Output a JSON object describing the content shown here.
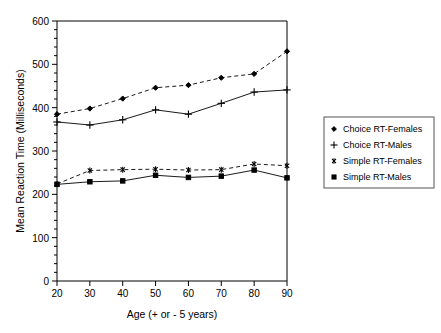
{
  "chart_data": {
    "type": "line",
    "title": "",
    "xlabel": "Age (+ or - 5 years)",
    "ylabel": "Mean Reaction Time (Milliseconds)",
    "x": [
      20,
      30,
      40,
      50,
      60,
      70,
      80,
      90
    ],
    "xlim": [
      20,
      90
    ],
    "ylim": [
      0,
      600
    ],
    "xticks": [
      "20",
      "30",
      "40",
      "50",
      "60",
      "70",
      "80",
      "90"
    ],
    "yticks": [
      "0",
      "100",
      "200",
      "300",
      "400",
      "500",
      "600"
    ],
    "y_minor_tick_step": 20,
    "grid": false,
    "legend_position": "right-outside",
    "series": [
      {
        "name": "Choice RT-Females",
        "marker": "diamond",
        "linestyle": "dashed",
        "color": "#000000",
        "values": [
          385,
          398,
          421,
          446,
          452,
          469,
          478,
          530
        ]
      },
      {
        "name": "Choice RT-Males",
        "marker": "plus",
        "linestyle": "solid",
        "color": "#000000",
        "values": [
          367,
          360,
          372,
          395,
          385,
          410,
          436,
          441
        ]
      },
      {
        "name": "Simple RT-Females",
        "marker": "asterisk",
        "linestyle": "dashed",
        "color": "#000000",
        "values": [
          224,
          255,
          257,
          258,
          256,
          257,
          270,
          266
        ]
      },
      {
        "name": "Simple RT-Males",
        "marker": "square",
        "linestyle": "solid",
        "color": "#000000",
        "values": [
          223,
          229,
          231,
          244,
          239,
          242,
          256,
          238
        ]
      }
    ]
  },
  "axes": {
    "x_title": "Age (+ or - 5 years)",
    "y_title": "Mean Reaction Time (Milliseconds)",
    "y_tick_0": "0",
    "y_tick_1": "100",
    "y_tick_2": "200",
    "y_tick_3": "300",
    "y_tick_4": "400",
    "y_tick_5": "500",
    "y_tick_6": "600",
    "x_tick_0": "20",
    "x_tick_1": "30",
    "x_tick_2": "40",
    "x_tick_3": "50",
    "x_tick_4": "60",
    "x_tick_5": "70",
    "x_tick_6": "80",
    "x_tick_7": "90"
  },
  "legend": {
    "entries": [
      {
        "label": "Choice RT-Females",
        "marker": "diamond-icon"
      },
      {
        "label": "Choice RT-Males",
        "marker": "plus-icon"
      },
      {
        "label": "Simple RT-Females",
        "marker": "asterisk-icon"
      },
      {
        "label": "Simple RT-Males",
        "marker": "square-icon"
      }
    ]
  },
  "colors": {
    "ink": "#000000",
    "line": "#1a1a1a",
    "legend_border": "#555555",
    "background": "#ffffff"
  }
}
